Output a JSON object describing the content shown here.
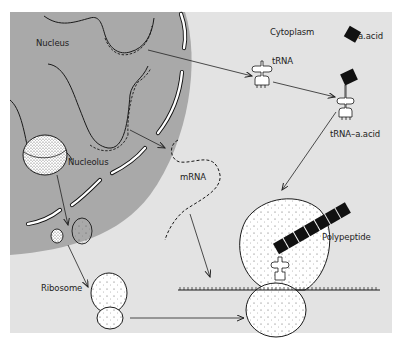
{
  "figure": {
    "type": "diagram",
    "colors": {
      "page_background": "#ffffff",
      "cytoplasm": "#e3e3e3",
      "nucleus": "#a9a9a9",
      "outline": "#1a1a1a",
      "amino_acid": "#111111",
      "ribosome_fill": "#ffffff"
    },
    "regions": {
      "nucleus": "Nucleus",
      "cytoplasm": "Cytoplasm"
    },
    "labels": {
      "nucleus": "Nucleus",
      "nucleolus": "Nucleolus",
      "cytoplasm": "Cytoplasm",
      "amino_acid": "a.acid",
      "trna": "tRNA",
      "trna_aacid": "tRNA–a.acid",
      "mrna": "mRNA",
      "ribosome": "Ribosome",
      "polypeptide": "Polypeptide"
    },
    "flows": [
      {
        "from": "DNA (Nucleus)",
        "to": "tRNA"
      },
      {
        "from": "tRNA",
        "to": "tRNA–a.acid"
      },
      {
        "from": "tRNA–a.acid",
        "to": "Ribosome (translation)"
      },
      {
        "from": "DNA (Nucleus)",
        "to": "mRNA"
      },
      {
        "from": "mRNA",
        "to": "mRNA strand on ribosome"
      },
      {
        "from": "Nucleolus",
        "to": "Ribosome subunits"
      },
      {
        "from": "Ribosome subunits",
        "to": "Ribosome"
      },
      {
        "from": "Ribosome",
        "to": "Translating ribosome"
      }
    ]
  }
}
